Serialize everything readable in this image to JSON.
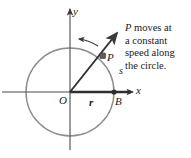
{
  "figure": {
    "background_color": "#ffffff",
    "axis_color": "#4a4a4a",
    "circle_color": "#8a8a8a",
    "radius_color": "#3a3a3a",
    "text_color": "#1a1a1a"
  },
  "axes": {
    "y_label": "y",
    "x_label": "x",
    "origin_label": "O"
  },
  "labels": {
    "radius": "r",
    "point_on_axis": "B",
    "moving_point": "P",
    "arc_length": "s"
  },
  "caption": {
    "line1_emphasis": "P",
    "line1_rest": " moves at",
    "line2": "a constant",
    "line3": "speed along",
    "line4": "the circle."
  },
  "geometry": {
    "center_x": 70,
    "center_y": 92,
    "radius_px": 44,
    "point_p_x": 103,
    "point_p_y": 56,
    "point_b_x": 114,
    "point_b_y": 92,
    "ray_tip_x": 119,
    "ray_tip_y": 31,
    "direction_arrow": "counterclockwise"
  }
}
